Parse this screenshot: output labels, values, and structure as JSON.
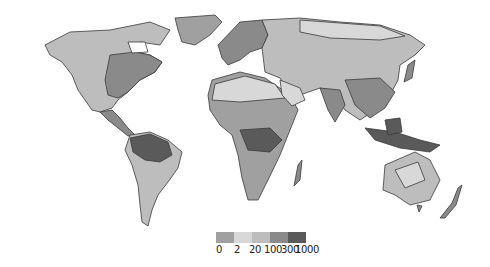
{
  "map": {
    "type": "world-choropleth",
    "background": "#ffffff",
    "ocean_color": "#ffffff",
    "coastline_color": "#3a3a3a"
  },
  "legend": {
    "colors": [
      "#a0a0a0",
      "#d8d8d8",
      "#bdbdbd",
      "#8a8a8a",
      "#5a5a5a"
    ],
    "labels": [
      "0",
      "2",
      "20",
      "100",
      "300",
      "1000"
    ]
  }
}
